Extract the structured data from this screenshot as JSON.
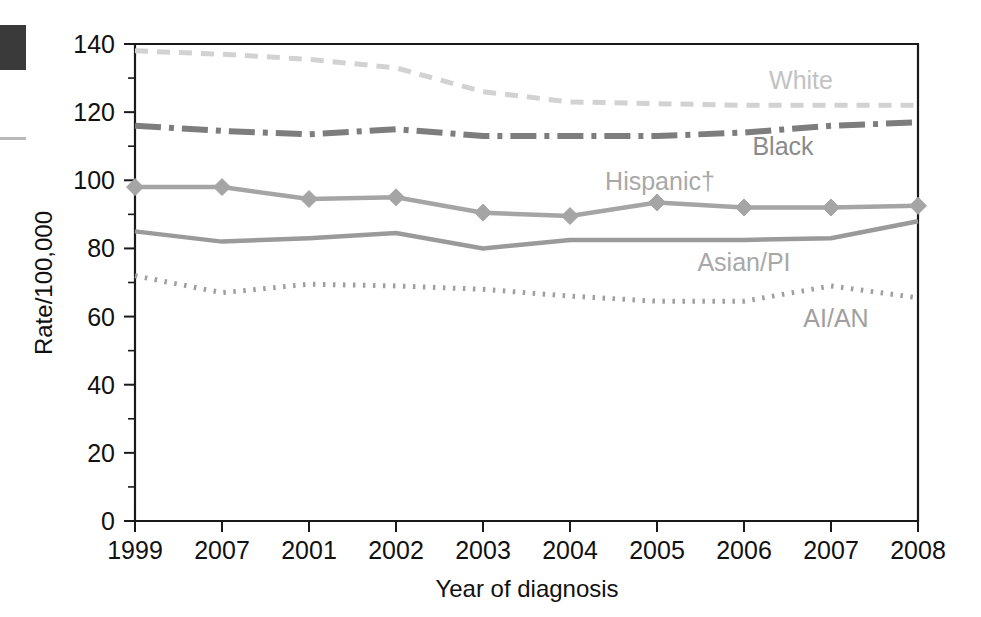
{
  "figure": {
    "xlabel": "Year of diagnosis",
    "ylabel": "Rate/100,000"
  },
  "axis": {
    "y_ticks": [
      "0",
      "20",
      "40",
      "60",
      "80",
      "100",
      "120",
      "140"
    ],
    "x_ticks": [
      "1999",
      "2007",
      "2001",
      "2002",
      "2003",
      "2004",
      "2005",
      "2006",
      "2007",
      "2008"
    ]
  },
  "series_labels": {
    "white": "White",
    "black": "Black",
    "hispanic": "Hispanic†",
    "asian_pi": "Asian/PI",
    "ai_an": "AI/AN"
  },
  "colors": {
    "white": "#d2d2d2",
    "black": "#7d7d7d",
    "hispanic": "#a5a5a5",
    "asian_pi": "#9a9a9a",
    "ai_an": "#9f9f9f",
    "axis": "#1a1a1a",
    "text": "#111111",
    "label_white": "#c2c2c2",
    "label_black": "#8a8a8a",
    "label_hispanic": "#a8a8a8",
    "label_asian": "#a8a8a8",
    "label_aian": "#a0a0a0"
  },
  "chart_data": {
    "type": "line",
    "title": "",
    "xlabel": "Year of diagnosis",
    "ylabel": "Rate/100,000",
    "categories": [
      "1999",
      "2007",
      "2001",
      "2002",
      "2003",
      "2004",
      "2005",
      "2006",
      "2007",
      "2008"
    ],
    "ylim": [
      0,
      140
    ],
    "xlim": [
      0,
      9
    ],
    "ytick_step": 20,
    "yminor_step": 10,
    "grid": false,
    "legend": "inline-annotations",
    "footnote_marker": "†",
    "series": [
      {
        "name": "White",
        "style": "dashed",
        "marker": "none",
        "color": "#d2d2d2",
        "values": [
          138,
          137,
          135.5,
          133,
          126,
          123,
          122.5,
          122,
          122,
          122
        ]
      },
      {
        "name": "Black",
        "style": "dash-dot",
        "marker": "none",
        "color": "#7d7d7d",
        "values": [
          116,
          114.5,
          113.5,
          115,
          113,
          113,
          113,
          114,
          116,
          117
        ]
      },
      {
        "name": "Hispanic†",
        "style": "solid",
        "marker": "diamond",
        "color": "#a5a5a5",
        "values": [
          98,
          98,
          94.5,
          95,
          90.5,
          89.5,
          93.5,
          92,
          92,
          92.5
        ]
      },
      {
        "name": "Asian/PI",
        "style": "solid",
        "marker": "none",
        "color": "#9a9a9a",
        "values": [
          85,
          82,
          83,
          84.5,
          80,
          82.5,
          82.5,
          82.5,
          83,
          88
        ]
      },
      {
        "name": "AI/AN",
        "style": "dotted",
        "marker": "none",
        "color": "#9f9f9f",
        "values": [
          72,
          67,
          69.5,
          69,
          68,
          66,
          64.5,
          64.5,
          69,
          65.5
        ]
      }
    ]
  }
}
